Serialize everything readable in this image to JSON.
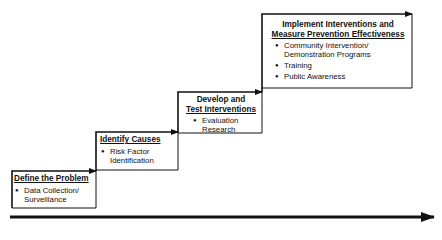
{
  "diagram": {
    "type": "staircase-process",
    "steps": [
      {
        "title": "Define the Problem",
        "bullets": [
          "Data Collection/ Surveillance"
        ]
      },
      {
        "title": "Identify Causes",
        "bullets": [
          "Risk Factor Identification"
        ]
      },
      {
        "title_line1": "Develop and",
        "title_line2": "Test Interventions",
        "bullets": [
          "Evaluation Research"
        ]
      },
      {
        "title_line1": "Implement Interventions and",
        "title_line2": "Measure Prevention Effectiveness",
        "bullets": [
          "Community Intervention/ Demonstration Programs",
          "Training",
          "Public Awareness"
        ]
      }
    ],
    "colors": {
      "line": "#111111",
      "background": "#ffffff"
    }
  }
}
